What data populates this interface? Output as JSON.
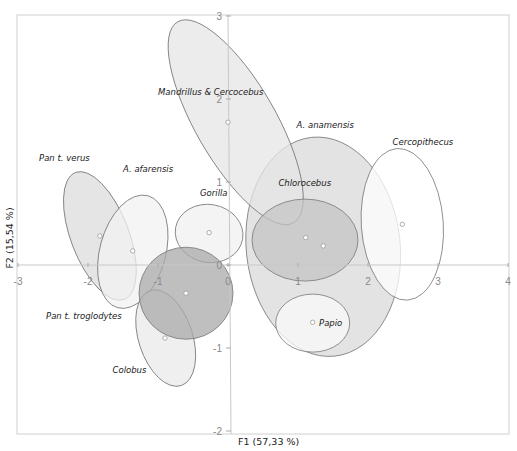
{
  "chart_data": {
    "type": "scatter",
    "title": "",
    "xlabel": "F1 (57,33 %)",
    "ylabel": "F2 (15,54 %)",
    "xlim": [
      -3,
      4
    ],
    "ylim": [
      -2,
      3
    ],
    "xticks": [
      -3,
      -2,
      -1,
      0,
      1,
      2,
      3,
      4
    ],
    "yticks": [
      -2,
      -1,
      0,
      1,
      2,
      3
    ],
    "grid": false,
    "legend": "none (labels placed next to groups)",
    "series": [
      {
        "name": "Mandrillus & Cercocebus",
        "centroid": [
          0.0,
          1.72
        ],
        "ellipse": {
          "cx": 0.11,
          "cy": 1.72,
          "rx_px": 116,
          "ry_px": 40,
          "angle": 60
        },
        "fill": "#e6e6e6",
        "label_pos": [
          -1.0,
          2.05
        ]
      },
      {
        "name": "Pan t. verus",
        "centroid": [
          -1.83,
          0.35
        ],
        "ellipse": {
          "cx": -1.83,
          "cy": 0.35,
          "rx_px": 68,
          "ry_px": 29,
          "angle": 69
        },
        "fill": "#dcdcdc",
        "label_pos": [
          -2.7,
          1.25
        ]
      },
      {
        "name": "A. afarensis",
        "centroid": [
          -1.36,
          0.17
        ],
        "ellipse": {
          "cx": -1.36,
          "cy": 0.16,
          "rx_px": 58,
          "ry_px": 33,
          "angle": 105
        },
        "fill": "#f2f2f2",
        "label_pos": [
          -1.5,
          1.12
        ]
      },
      {
        "name": "Gorilla",
        "centroid": [
          -0.27,
          0.39
        ],
        "ellipse": {
          "cx": -0.27,
          "cy": 0.38,
          "rx_px": 34,
          "ry_px": 29,
          "angle": 10
        },
        "fill": "#f0f0f0",
        "label_pos": [
          -0.4,
          0.83
        ]
      },
      {
        "name": "Pan t. troglodytes",
        "centroid": [
          -0.6,
          -0.34
        ],
        "ellipse": {
          "cx": -0.6,
          "cy": -0.34,
          "rx_px": 47,
          "ry_px": 46,
          "angle": 0
        },
        "fill": "#a9a9a9",
        "label_pos": [
          -2.6,
          -0.65
        ]
      },
      {
        "name": "Colobus",
        "centroid": [
          -0.9,
          -0.88
        ],
        "ellipse": {
          "cx": -0.89,
          "cy": -0.88,
          "rx_px": 50,
          "ry_px": 27,
          "angle": 72
        },
        "fill": "#eaeaea",
        "label_pos": [
          -1.65,
          -1.3
        ]
      },
      {
        "name": "A. anamensis",
        "centroid": [
          1.36,
          0.23
        ],
        "ellipse": {
          "cx": 1.36,
          "cy": 0.22,
          "rx_px": 77,
          "ry_px": 110,
          "angle": -6
        },
        "fill": "#dadada",
        "label_pos": [
          0.98,
          1.65
        ]
      },
      {
        "name": "Chlorocebus",
        "centroid": [
          1.11,
          0.33
        ],
        "ellipse": {
          "cx": 1.1,
          "cy": 0.3,
          "rx_px": 53,
          "ry_px": 41,
          "angle": 0
        },
        "fill": "#c4c4c4",
        "label_pos": [
          0.72,
          0.95
        ]
      },
      {
        "name": "Papio",
        "centroid": [
          1.21,
          -0.69
        ],
        "ellipse": {
          "cx": 1.21,
          "cy": -0.7,
          "rx_px": 37,
          "ry_px": 29,
          "angle": 0
        },
        "fill": "#fafafa",
        "label_pos": [
          1.3,
          -0.73
        ]
      },
      {
        "name": "Cercopithecus",
        "centroid": [
          2.49,
          0.49
        ],
        "ellipse": {
          "cx": 2.49,
          "cy": 0.49,
          "rx_px": 41,
          "ry_px": 76,
          "angle": -4
        },
        "fill": "#ffffff",
        "label_pos": [
          2.35,
          1.45
        ]
      }
    ]
  },
  "colors": {
    "frame": "#d0d0d0",
    "axis": "#c8c8c8",
    "ellipse_stroke": "#777777",
    "point_stroke": "#999999"
  }
}
